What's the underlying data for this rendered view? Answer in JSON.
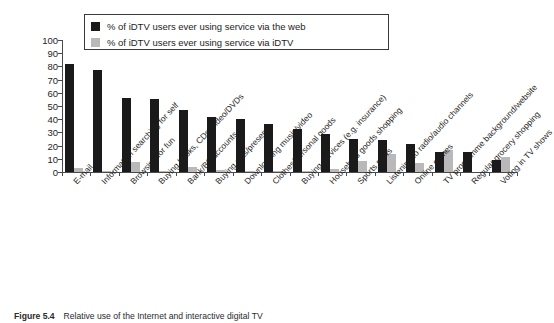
{
  "chart_data": {
    "type": "bar",
    "title": "",
    "xlabel": "",
    "ylabel": "",
    "ylim": [
      0,
      100
    ],
    "ytick_step": 10,
    "yticks": [
      100,
      90,
      80,
      70,
      60,
      50,
      40,
      30,
      20,
      10,
      0
    ],
    "grid": false,
    "legend_position": "top-left-inside",
    "colors": {
      "web": "#1a1a1a",
      "idtv": "#b9b9b9"
    },
    "categories": [
      "E-mail",
      "Information searching for self",
      "Browsing for fun",
      "Buying books, CDs, video/DVDs",
      "Bank/BS accounts",
      "Buying gifts/presents",
      "Downloading music/video",
      "Clothes/personal goods",
      "Buying services (e.g. insurance)",
      "Household goods shopping",
      "Sports news",
      "Listening to radio/audio channels",
      "Online games",
      "TV programme background/website",
      "Regular grocery shopping",
      "Voting in TV shows"
    ],
    "series": [
      {
        "name": "% of iDTV users ever using service via the web",
        "key": "web",
        "values": [
          82,
          77,
          56,
          55,
          47,
          42,
          40,
          36.5,
          32.5,
          29,
          25,
          24,
          21,
          15,
          15,
          9
        ]
      },
      {
        "name": "% of iDTV users ever using service via iDTV",
        "key": "idtv",
        "values": [
          3,
          1,
          7.5,
          1,
          3.5,
          1.5,
          1,
          1,
          0.5,
          2,
          8,
          14,
          7,
          17,
          0,
          11
        ]
      }
    ]
  },
  "legend": {
    "items": [
      {
        "label": "% of iDTV users ever using service via the web",
        "color": "#1a1a1a"
      },
      {
        "label": "% of iDTV users ever using service via iDTV",
        "color": "#b9b9b9"
      }
    ]
  },
  "caption": {
    "number": "Figure 5.4",
    "text": "Relative use of the Internet and interactive digital TV"
  }
}
